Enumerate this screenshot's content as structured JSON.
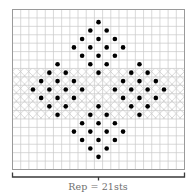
{
  "chart": {
    "columns": 21,
    "rows": 19,
    "grid_color": "#c8c8c8",
    "border_color": "#9a9a9a",
    "dot_color": "#000000",
    "hatch_color": "#bdbdbd",
    "hatch_band": {
      "start_row": 7,
      "end_row": 12
    },
    "dots": [
      [
        1,
        [
          10
        ]
      ],
      [
        2,
        [
          9,
          11
        ]
      ],
      [
        3,
        [
          8,
          10,
          12
        ]
      ],
      [
        4,
        [
          7,
          9,
          11,
          13
        ]
      ],
      [
        5,
        [
          8,
          10,
          12
        ]
      ],
      [
        6,
        [
          5,
          9,
          11,
          15
        ]
      ],
      [
        7,
        [
          4,
          6,
          10,
          14,
          16
        ]
      ],
      [
        8,
        [
          3,
          5,
          7,
          13,
          15,
          17
        ]
      ],
      [
        9,
        [
          2,
          4,
          6,
          8,
          12,
          14,
          16,
          18
        ]
      ],
      [
        10,
        [
          3,
          5,
          7,
          13,
          15,
          17
        ]
      ],
      [
        11,
        [
          4,
          6,
          10,
          14,
          16
        ]
      ],
      [
        12,
        [
          5,
          9,
          11,
          15
        ]
      ],
      [
        13,
        [
          8,
          10,
          12
        ]
      ],
      [
        14,
        [
          7,
          9,
          11,
          13
        ]
      ],
      [
        15,
        [
          8,
          10,
          12
        ]
      ],
      [
        16,
        [
          9,
          11
        ]
      ],
      [
        17,
        [
          10
        ]
      ]
    ]
  },
  "repeat": {
    "label": "Rep = 21sts",
    "stitches": 21
  }
}
